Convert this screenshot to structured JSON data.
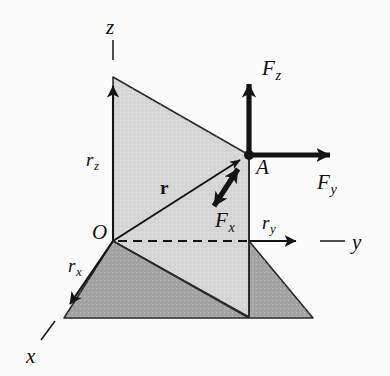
{
  "figure": {
    "background_color": "#fbfbfb",
    "stroke_color": "#1a1a1a",
    "fill_light_gray": "#d6d6d6",
    "fill_dark_gray": "#a3a3a3"
  },
  "axes": [
    {
      "id": "x-axis",
      "label": "x",
      "label_x": 26,
      "label_y": 346,
      "direction": "down-left"
    },
    {
      "id": "y-axis",
      "label": "y",
      "label_x": 352,
      "label_y": 232,
      "direction": "right"
    },
    {
      "id": "z-axis",
      "label": "z",
      "label_x": 106,
      "label_y": 17,
      "direction": "up"
    }
  ],
  "points": [
    {
      "id": "origin",
      "label": "O",
      "label_x": 92,
      "label_y": 222,
      "x": 113,
      "y": 241
    },
    {
      "id": "point-a",
      "label": "A",
      "label_x": 256,
      "label_y": 157,
      "x": 249,
      "y": 155
    }
  ],
  "vectors": [
    {
      "id": "position-vector-r",
      "label": "r",
      "label_x": 160,
      "label_y": 178,
      "style": "bold-upright",
      "from": [
        113,
        241
      ],
      "to": [
        249,
        155
      ],
      "arrowheads": "single"
    },
    {
      "id": "force-fz",
      "label": "F",
      "subscript": "z",
      "label_x": 262,
      "label_y": 58,
      "from": [
        249,
        155
      ],
      "to": [
        249,
        72
      ],
      "arrowheads": "single",
      "thickness": "heavy"
    },
    {
      "id": "force-fy",
      "label": "F",
      "subscript": "y",
      "label_x": 317,
      "label_y": 172,
      "from": [
        249,
        155
      ],
      "to": [
        342,
        155
      ],
      "arrowheads": "single",
      "thickness": "heavy"
    },
    {
      "id": "force-fx",
      "label": "F",
      "subscript": "x",
      "label_x": 215,
      "label_y": 210,
      "from": [
        244,
        159
      ],
      "to": [
        207,
        216
      ],
      "arrowheads": "double",
      "thickness": "heavy"
    }
  ],
  "components": [
    {
      "id": "component-rz",
      "label": "r",
      "subscript": "z",
      "label_x": 86,
      "label_y": 150
    },
    {
      "id": "component-rx",
      "label": "r",
      "subscript": "x",
      "label_x": 68,
      "label_y": 256
    },
    {
      "id": "component-ry",
      "label": "r",
      "subscript": "y",
      "label_x": 262,
      "label_y": 213
    }
  ],
  "shapes": [
    {
      "id": "base-plane-parallelogram",
      "fill": "#a3a3a3",
      "points": "113,241 249,241 313,318 64,318"
    },
    {
      "id": "vertical-plane-quad",
      "fill": "#d6d6d6",
      "points": "113,77 249,155 249,317 113,241"
    }
  ],
  "dashed_line": {
    "id": "projection-dashed-line",
    "from": [
      116,
      241
    ],
    "to": [
      298,
      241
    ]
  }
}
